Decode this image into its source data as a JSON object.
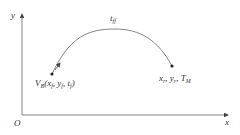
{
  "axes": {
    "x_label": "x",
    "y_label": "y",
    "origin_label": "O"
  },
  "curve": {
    "label_main": "t",
    "label_sub": "ff"
  },
  "start_point": {
    "V": "V",
    "V_sub": "B",
    "open": "(",
    "x": "x",
    "x_sub": "f",
    "sep1": ", ",
    "y": "y",
    "y_sub": "f",
    "sep2": ", ",
    "t": "t",
    "t_sub": "f",
    "close": ")"
  },
  "end_point": {
    "x": "x",
    "x_sub": "r",
    "sep1": ", ",
    "y": "y",
    "y_sub": "r",
    "sep2": ", ",
    "T": "T",
    "T_sub": "M"
  },
  "colors": {
    "line": "#555555",
    "text": "#333333"
  }
}
